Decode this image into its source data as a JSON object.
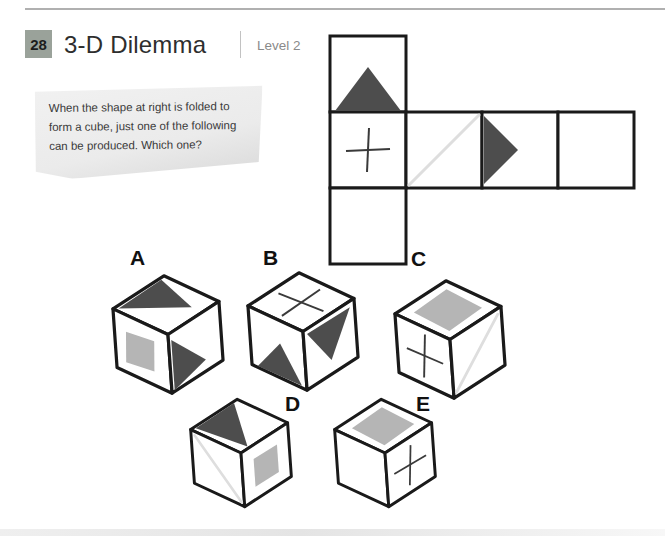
{
  "page": {
    "number": "28",
    "title": "3-D Dilemma",
    "level": "Level 2"
  },
  "question": {
    "lines": [
      "When the shape at right is folded to",
      "form a cube, just one of the following",
      "can be produced. Which one?"
    ]
  },
  "net": {
    "shape": "cross-shaped cube net, 3 squares tall on left column, 4 squares wide middle row",
    "cells": [
      {
        "row": 0,
        "col": 0,
        "symbol": "dark-triangle-up"
      },
      {
        "row": 1,
        "col": 0,
        "symbol": "plus-cross"
      },
      {
        "row": 1,
        "col": 1,
        "symbol": "faint-diagonal-line"
      },
      {
        "row": 1,
        "col": 2,
        "symbol": "dark-triangle-right"
      },
      {
        "row": 1,
        "col": 3,
        "symbol": "empty"
      },
      {
        "row": 2,
        "col": 0,
        "symbol": "gray-square"
      }
    ]
  },
  "options": [
    {
      "label": "A",
      "faces": {
        "top": "dark-triangle",
        "left": "gray-square",
        "right": "dark-triangle"
      }
    },
    {
      "label": "B",
      "faces": {
        "top": "plus-cross",
        "left": "dark-triangle-up",
        "right": "dark-triangle-down"
      }
    },
    {
      "label": "C",
      "faces": {
        "top": "gray-square",
        "left": "plus-cross",
        "right": "faint-diagonal-line"
      }
    },
    {
      "label": "D",
      "faces": {
        "top": "dark-triangle",
        "left": "faint-diagonal-line",
        "right": "gray-square"
      }
    },
    {
      "label": "E",
      "faces": {
        "top": "gray-square",
        "left": "empty",
        "right": "plus-cross"
      }
    }
  ],
  "colors": {
    "dark_shape": "#4d4d4d",
    "gray_shape": "#b5b5b5",
    "faint_line": "#dedede",
    "badge_bg": "#9aa29a",
    "line": "#1a1a1a"
  }
}
